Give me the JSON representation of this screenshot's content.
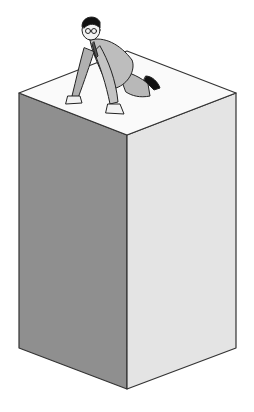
{
  "scene": {
    "description": "Man in a suit crawling on top of a tall box",
    "colors": {
      "background": "#ffffff",
      "box_top": "#fafafa",
      "box_left": "#8f8f8f",
      "box_right": "#e4e4e4",
      "outline": "#333333",
      "suit": "#b8b8b8",
      "hair": "#111111",
      "skin": "#f2f2f2"
    }
  }
}
